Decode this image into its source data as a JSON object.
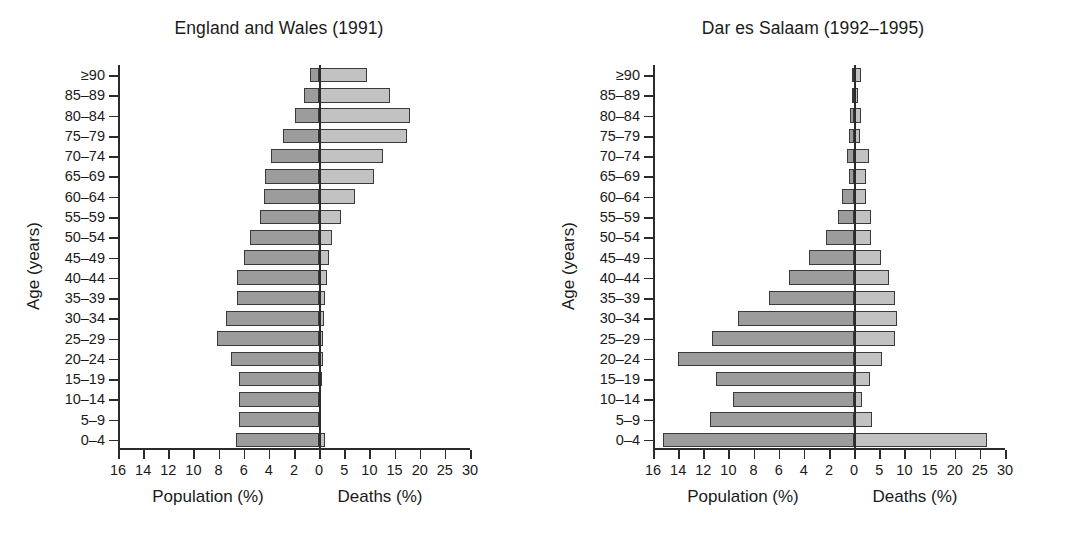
{
  "figure": {
    "axis_titles": {
      "y": "Age (years)",
      "x_left": "Population (%)",
      "x_right": "Deaths (%)"
    }
  },
  "chart_data": [
    {
      "type": "bar",
      "title": "England and Wales (1991)",
      "orientation": "horizontal",
      "style": "population-pyramid",
      "ylabel": "Age (years)",
      "xlabel_left": "Population (%)",
      "xlabel_right": "Deaths (%)",
      "grid": false,
      "legend": "none",
      "categories": [
        "≥90",
        "85–89",
        "80–84",
        "75–79",
        "70–74",
        "65–69",
        "60–64",
        "55–59",
        "50–54",
        "45–49",
        "40–44",
        "35–39",
        "30–34",
        "25–29",
        "20–24",
        "15–19",
        "10–14",
        "5–9",
        "0–4"
      ],
      "left_axis": {
        "name": "Population (%)",
        "ticks": [
          16,
          14,
          12,
          10,
          8,
          6,
          4,
          2,
          0
        ],
        "tick_labels": [
          "16",
          "14",
          "12",
          "10",
          "8",
          "6",
          "4",
          "2",
          "0"
        ],
        "max": 16
      },
      "right_axis": {
        "name": "Deaths (%)",
        "ticks": [
          5,
          10,
          15,
          20,
          25,
          30
        ],
        "tick_labels": [
          "5",
          "10",
          "15",
          "20",
          "25",
          "30"
        ],
        "max": 30
      },
      "series": [
        {
          "name": "Population (%)",
          "side": "left",
          "color": "#9c9c9c",
          "values": [
            0.7,
            1.2,
            1.9,
            2.9,
            3.8,
            4.3,
            4.4,
            4.7,
            5.5,
            6.0,
            6.5,
            6.5,
            7.4,
            8.1,
            7.0,
            6.4,
            6.4,
            6.4,
            6.6
          ]
        },
        {
          "name": "Deaths (%)",
          "side": "right",
          "color": "#c2c2c2",
          "values": [
            9.5,
            14.0,
            18.0,
            17.5,
            12.6,
            11.0,
            7.2,
            4.3,
            2.6,
            1.9,
            1.5,
            1.1,
            0.9,
            0.8,
            0.8,
            0.5,
            0.4,
            0.4,
            1.1
          ]
        }
      ]
    },
    {
      "type": "bar",
      "title": "Dar es Salaam (1992–1995)",
      "orientation": "horizontal",
      "style": "population-pyramid",
      "ylabel": "Age (years)",
      "xlabel_left": "Population (%)",
      "xlabel_right": "Deaths (%)",
      "grid": false,
      "legend": "none",
      "categories": [
        "≥90",
        "85–89",
        "80–84",
        "75–79",
        "70–74",
        "65–69",
        "60–64",
        "55–59",
        "50–54",
        "45–49",
        "40–44",
        "35–39",
        "30–34",
        "25–29",
        "20–24",
        "15–19",
        "10–14",
        "5–9",
        "0–4"
      ],
      "left_axis": {
        "name": "Population (%)",
        "ticks": [
          16,
          14,
          12,
          10,
          8,
          6,
          4,
          2,
          0
        ],
        "tick_labels": [
          "16",
          "14",
          "12",
          "10",
          "8",
          "6",
          "4",
          "2",
          "0"
        ],
        "max": 16
      },
      "right_axis": {
        "name": "Deaths (%)",
        "ticks": [
          5,
          10,
          15,
          20,
          25,
          30
        ],
        "tick_labels": [
          "5",
          "10",
          "15",
          "20",
          "25",
          "30"
        ],
        "max": 30
      },
      "series": [
        {
          "name": "Population (%)",
          "side": "left",
          "color": "#9c9c9c",
          "values": [
            0.1,
            0.1,
            0.3,
            0.4,
            0.6,
            0.4,
            1.0,
            1.3,
            2.2,
            3.6,
            5.2,
            6.8,
            9.2,
            11.3,
            14.0,
            11.0,
            9.6,
            11.5,
            15.2
          ]
        },
        {
          "name": "Deaths (%)",
          "side": "right",
          "color": "#c2c2c2",
          "values": [
            1.4,
            0.7,
            1.4,
            1.1,
            3.0,
            2.3,
            2.3,
            3.3,
            3.3,
            5.3,
            7.0,
            8.2,
            8.6,
            8.2,
            5.5,
            3.1,
            1.5,
            3.5,
            26.5
          ]
        }
      ]
    }
  ]
}
